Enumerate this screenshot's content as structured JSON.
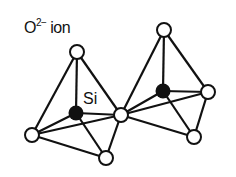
{
  "diagram": {
    "labels": {
      "ion_base": "O",
      "ion_charge": "2−",
      "ion_word": " ion",
      "si": "Si"
    },
    "colors": {
      "line": "#111111",
      "oxygen_fill": "#ffffff",
      "silicon_fill": "#111111"
    },
    "nodes": [
      {
        "id": "o_left_top",
        "type": "O",
        "x": 77,
        "y": 52
      },
      {
        "id": "si_left",
        "type": "Si",
        "x": 76,
        "y": 113
      },
      {
        "id": "o_left_bl",
        "type": "O",
        "x": 32,
        "y": 135
      },
      {
        "id": "o_left_bottom",
        "type": "O",
        "x": 106,
        "y": 158
      },
      {
        "id": "o_shared",
        "type": "O",
        "x": 121,
        "y": 115
      },
      {
        "id": "o_right_top",
        "type": "O",
        "x": 164,
        "y": 30
      },
      {
        "id": "si_right",
        "type": "Si",
        "x": 163,
        "y": 91
      },
      {
        "id": "o_right_r",
        "type": "O",
        "x": 208,
        "y": 92
      },
      {
        "id": "o_right_bottom",
        "type": "O",
        "x": 194,
        "y": 137
      }
    ],
    "edges": [
      [
        "o_left_top",
        "o_left_bl"
      ],
      [
        "o_left_top",
        "o_shared"
      ],
      [
        "o_left_top",
        "si_left"
      ],
      [
        "o_left_bl",
        "o_shared"
      ],
      [
        "o_left_bl",
        "o_left_bottom"
      ],
      [
        "o_left_bottom",
        "o_shared"
      ],
      [
        "o_left_bl",
        "si_left"
      ],
      [
        "si_left",
        "o_shared"
      ],
      [
        "si_left",
        "o_left_bottom"
      ],
      [
        "o_right_top",
        "o_shared"
      ],
      [
        "o_right_top",
        "o_right_r"
      ],
      [
        "o_right_top",
        "si_right"
      ],
      [
        "o_shared",
        "o_right_r"
      ],
      [
        "o_shared",
        "o_right_bottom"
      ],
      [
        "o_right_r",
        "o_right_bottom"
      ],
      [
        "si_right",
        "o_shared"
      ],
      [
        "si_right",
        "o_right_r"
      ],
      [
        "si_right",
        "o_right_bottom"
      ]
    ]
  }
}
